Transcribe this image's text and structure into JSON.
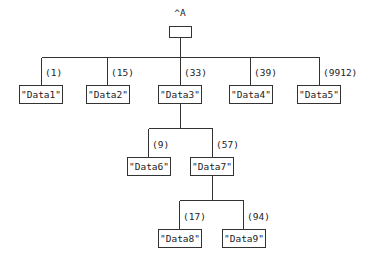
{
  "root": {
    "label": "^A",
    "x": 180,
    "box": {
      "x": 169,
      "y": 26,
      "w": 22,
      "h": 11
    }
  },
  "edge_color": "#333333",
  "nodes": [
    {
      "id": "n1",
      "text": "\"Data1\"",
      "weight": "(1)",
      "cx": 41,
      "box": {
        "x": 19,
        "y": 85,
        "w": 43,
        "h": 18
      }
    },
    {
      "id": "n2",
      "text": "\"Data2\"",
      "weight": "(15)",
      "cx": 107,
      "box": {
        "x": 86,
        "y": 85,
        "w": 43,
        "h": 18
      }
    },
    {
      "id": "n3",
      "text": "\"Data3\"",
      "weight": "(33)",
      "cx": 180,
      "box": {
        "x": 158,
        "y": 85,
        "w": 43,
        "h": 18
      }
    },
    {
      "id": "n4",
      "text": "\"Data4\"",
      "weight": "(39)",
      "cx": 250,
      "box": {
        "x": 229,
        "y": 85,
        "w": 43,
        "h": 18
      }
    },
    {
      "id": "n5",
      "text": "\"Data5\"",
      "weight": "(9912)",
      "cx": 319,
      "box": {
        "x": 297,
        "y": 85,
        "w": 43,
        "h": 18
      }
    },
    {
      "id": "n6",
      "text": "\"Data6\"",
      "weight": "(9)",
      "cx": 148,
      "box": {
        "x": 127,
        "y": 157,
        "w": 43,
        "h": 18
      }
    },
    {
      "id": "n7",
      "text": "\"Data7\"",
      "weight": "(57)",
      "cx": 212,
      "box": {
        "x": 190,
        "y": 157,
        "w": 43,
        "h": 18
      }
    },
    {
      "id": "n8",
      "text": "\"Data8\"",
      "weight": "(17)",
      "cx": 179,
      "box": {
        "x": 158,
        "y": 229,
        "w": 43,
        "h": 18
      }
    },
    {
      "id": "n9",
      "text": "\"Data9\"",
      "weight": "(94)",
      "cx": 243,
      "box": {
        "x": 222,
        "y": 229,
        "w": 43,
        "h": 18
      }
    }
  ],
  "levels": [
    {
      "parent_cx": 180,
      "parent_bottom": 37,
      "bar_y": 57,
      "children": [
        "n1",
        "n2",
        "n3",
        "n4",
        "n5"
      ]
    },
    {
      "parent_cx": 180,
      "parent_bottom": 103,
      "bar_y": 128,
      "children": [
        "n6",
        "n7"
      ]
    },
    {
      "parent_cx": 212,
      "parent_bottom": 175,
      "bar_y": 200,
      "children": [
        "n8",
        "n9"
      ]
    }
  ]
}
